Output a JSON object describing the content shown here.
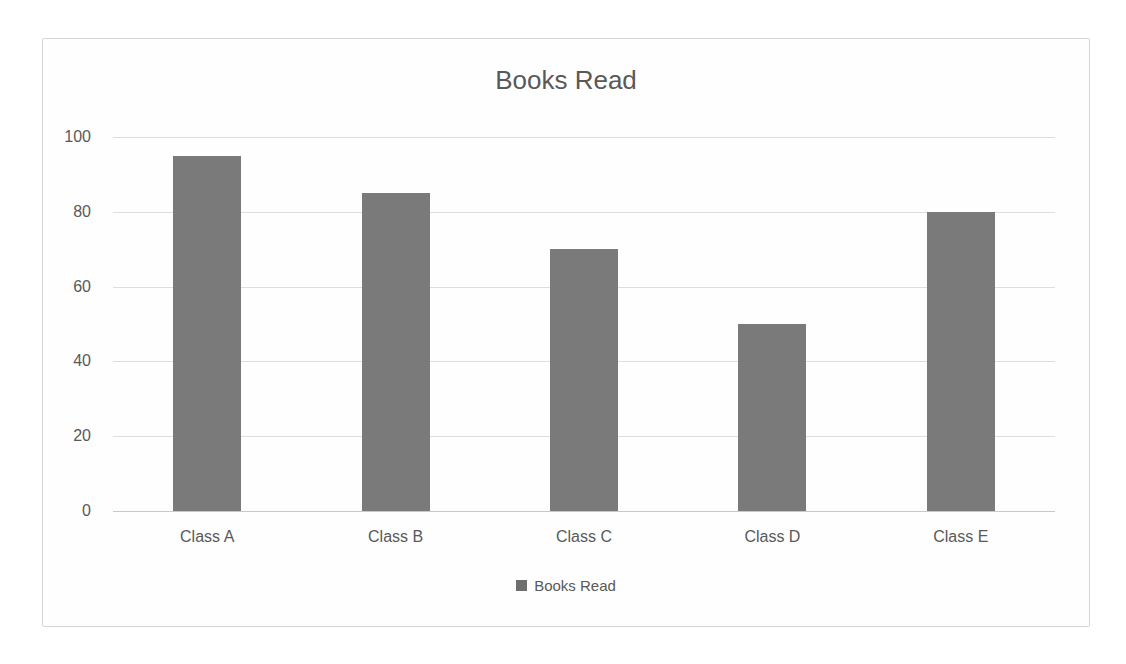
{
  "chart": {
    "legend_label": "Books Read",
    "colors": {
      "bar": "#7a7a7a",
      "text": "#595959",
      "gridline": "#dedede",
      "axis_line": "#c9c9c9",
      "card_border": "#d6d6d6",
      "legend_swatch": "#6e6e6e"
    }
  },
  "chart_data": {
    "type": "bar",
    "title": "Books Read",
    "categories": [
      "Class A",
      "Class B",
      "Class C",
      "Class D",
      "Class E"
    ],
    "values": [
      95,
      85,
      70,
      50,
      80
    ],
    "xlabel": "",
    "ylabel": "",
    "ylim": [
      0,
      100
    ],
    "yticks": [
      0,
      20,
      40,
      60,
      80,
      100
    ],
    "grid": true,
    "legend": [
      "Books Read"
    ],
    "legend_position": "bottom"
  }
}
